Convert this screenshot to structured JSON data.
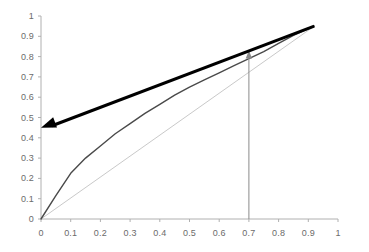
{
  "chart_data": {
    "type": "line",
    "title": "",
    "subtitle": "",
    "xlabel": "",
    "ylabel": "",
    "xlim": [
      0,
      1
    ],
    "ylim": [
      0,
      1
    ],
    "grid": false,
    "legend": "none",
    "xticks": [
      "0",
      "0.1",
      "0.2",
      "0.3",
      "0.4",
      "0.5",
      "0.6",
      "0.7",
      "0.8",
      "0.9",
      "1"
    ],
    "xtick_values": [
      0,
      0.1,
      0.2,
      0.3,
      0.4,
      0.5,
      0.6,
      0.7,
      0.8,
      0.9,
      1
    ],
    "yticks": [
      "0",
      "0.1",
      "0.2",
      "0.3",
      "0.4",
      "0.5",
      "0.6",
      "0.7",
      "0.8",
      "0.9",
      "1"
    ],
    "ytick_values": [
      0,
      0.1,
      0.2,
      0.3,
      0.4,
      0.5,
      0.6,
      0.7,
      0.8,
      0.9,
      1
    ],
    "series": [
      {
        "name": "diagonal-reference-line",
        "style": "line",
        "color": "#c9c9c9",
        "width": 1,
        "x": [
          0,
          0.92
        ],
        "values": [
          0,
          0.95
        ]
      },
      {
        "name": "concave-curve",
        "style": "curve",
        "color": "#4a4a4a",
        "width": 1.4,
        "x": [
          0,
          0.05,
          0.1,
          0.15,
          0.2,
          0.25,
          0.3,
          0.35,
          0.4,
          0.45,
          0.5,
          0.55,
          0.6,
          0.65,
          0.7,
          0.75,
          0.8,
          0.85,
          0.92
        ],
        "values": [
          0,
          0.115,
          0.225,
          0.3,
          0.36,
          0.42,
          0.47,
          0.52,
          0.565,
          0.61,
          0.65,
          0.685,
          0.72,
          0.755,
          0.79,
          0.825,
          0.865,
          0.905,
          0.95
        ]
      },
      {
        "name": "thick-tangent-line",
        "style": "thick-line-with-left-arrow",
        "color": "#000000",
        "width": 3,
        "x": [
          0.0,
          0.92
        ],
        "values": [
          0.45,
          0.95
        ]
      }
    ],
    "annotations": [
      {
        "name": "vertical-indicator-arrow",
        "type": "vertical-arrow",
        "color": "#8a8a8a",
        "x": 0.7,
        "y_start": 0,
        "y_end": 0.83,
        "direction": "up"
      },
      {
        "name": "tangent-arrowhead",
        "type": "arrowhead",
        "color": "#000000",
        "x": 0.0,
        "y": 0.45,
        "direction": "left"
      }
    ],
    "axis_color": "#b0b0b0",
    "tick_color": "#6b6b6b",
    "background": "#ffffff"
  }
}
